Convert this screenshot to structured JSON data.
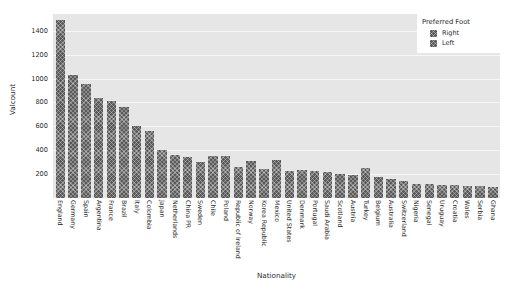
{
  "chart_data": {
    "type": "bar",
    "title": "",
    "xlabel": "Nationality",
    "ylabel": "Valcount",
    "ylim": [
      0,
      1540
    ],
    "grid": true,
    "yticks": [
      200,
      400,
      600,
      800,
      1000,
      1200,
      1400
    ],
    "legend": {
      "title": "Preferred Foot",
      "position": "upper right",
      "entries": [
        {
          "label": "Right",
          "color": "#5a5a5a"
        },
        {
          "label": "Left",
          "color": "#5a5a5a"
        }
      ]
    },
    "categories": [
      "England",
      "Germany",
      "Spain",
      "Argentina",
      "France",
      "Brazil",
      "Italy",
      "Colombia",
      "Japan",
      "Netherlands",
      "China PR",
      "Sweden",
      "Chile",
      "Poland",
      "Republic of Ireland",
      "Norway",
      "Korea Republic",
      "Mexico",
      "United States",
      "Denmark",
      "Portugal",
      "Saudi Arabia",
      "Scotland",
      "Austria",
      "Turkey",
      "Belgium",
      "Australia",
      "Switzerland",
      "Nigeria",
      "Senegal",
      "Uruguay",
      "Croatia",
      "Wales",
      "Serbia",
      "Ghana"
    ],
    "values": [
      1490,
      1030,
      955,
      840,
      815,
      760,
      605,
      560,
      400,
      360,
      345,
      300,
      355,
      350,
      260,
      310,
      240,
      320,
      230,
      235,
      225,
      220,
      200,
      195,
      250,
      175,
      160,
      140,
      120,
      115,
      110,
      105,
      100,
      100,
      95
    ]
  },
  "colors": {
    "plot_background": "#e6e6e6",
    "figure_background": "#ffffff",
    "gridline": "#f7f7f7",
    "bar": "#5a5a5a",
    "text": "#2b2b2b"
  }
}
